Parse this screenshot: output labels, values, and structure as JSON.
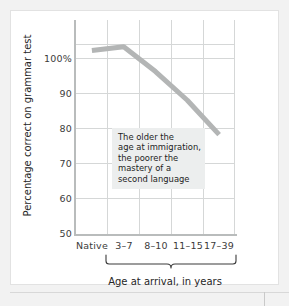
{
  "chart_data": {
    "type": "line",
    "title": "",
    "xlabel": "Age at arrival, in years",
    "ylabel": "Percentage correct on grammar test",
    "categories": [
      "Native",
      "3–7",
      "8–10",
      "11–15",
      "17–39"
    ],
    "values": [
      98,
      99,
      92.5,
      85,
      76
    ],
    "series": [
      {
        "name": "Percentage correct on grammar test",
        "values": [
          98,
          99,
          92.5,
          85,
          76
        ]
      }
    ],
    "ylim": [
      50,
      106
    ],
    "yticks": [
      "100%",
      "90",
      "80",
      "70",
      "60",
      "50"
    ],
    "ytick_values": [
      100,
      90,
      80,
      70,
      60,
      50
    ],
    "grid": true,
    "legend": false,
    "line_color": "#b3b5b5",
    "grid_color": "#d5d7d7",
    "axis_color": "#b9bcbc",
    "annotation_background": "#eceeee",
    "annotations": [
      {
        "lines": [
          "The older the",
          "age at immigration,",
          "the poorer the",
          "mastery of a",
          "second language"
        ]
      }
    ],
    "grouped_categories": [
      "3–7",
      "8–10",
      "11–15",
      "17–39"
    ],
    "group_label": "Age at arrival, in years"
  }
}
